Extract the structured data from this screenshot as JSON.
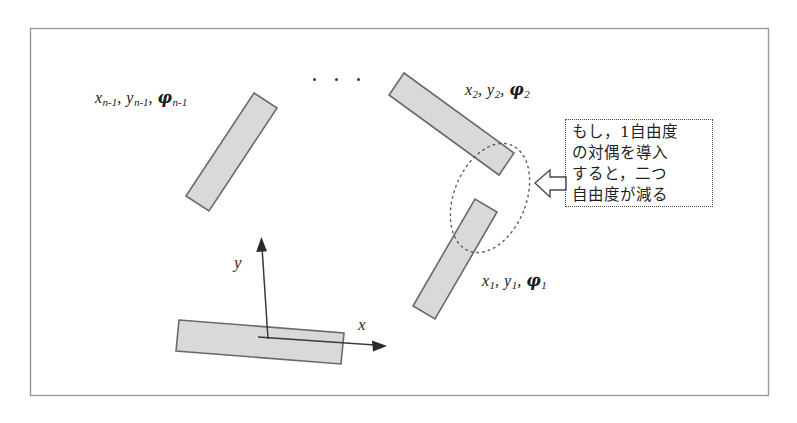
{
  "figure": {
    "frame": {
      "stroke": "#9a9a9a"
    },
    "link_fill": "#d9d9d9",
    "link_stroke": "#6a6a6a",
    "axis_stroke": "#3a3a3a",
    "callout_stroke": "#4a4a4a"
  },
  "labels": {
    "link_n_minus_1": {
      "x": "x",
      "x_sub": "n-1",
      "y": "y",
      "y_sub": "n-1",
      "phi": "φ",
      "phi_sub": "n-1"
    },
    "link_2": {
      "x": "x",
      "x_sub": "2",
      "y": "y",
      "y_sub": "2",
      "phi": "φ",
      "phi_sub": "2"
    },
    "link_1": {
      "x": "x",
      "x_sub": "1",
      "y": "y",
      "y_sub": "1",
      "phi": "φ",
      "phi_sub": "1"
    },
    "comma": ", ",
    "ellipsis": "· · ·"
  },
  "axes": {
    "x_label": "x",
    "y_label": "y"
  },
  "callout": {
    "lines": [
      "もし，1自由度",
      "の対偶を導入",
      "すると，二つ",
      "自由度が減る"
    ],
    "pointer": "left-block-arrow"
  }
}
